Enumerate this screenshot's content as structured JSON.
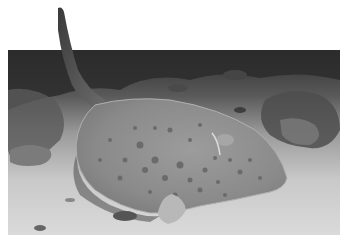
{
  "image": {
    "subject": "spotted stingray resting on sandy sea floor among coral",
    "style": "grayscale photograph",
    "colors": {
      "background": "#ffffff",
      "sand_light": "#d8d8d8",
      "sand_mid": "#bdbdbd",
      "coral_dark": "#2a2a2a",
      "coral_mid": "#6b6b6b",
      "ray_body": "#8e8e8e",
      "ray_edge": "#a8a8a8",
      "ray_spots": "#6a6a6a",
      "tail": "#4a4a4a"
    }
  }
}
